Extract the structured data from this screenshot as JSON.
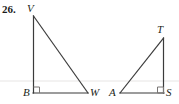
{
  "figure": {
    "problem_number": "26.",
    "background_color": "#ffffff",
    "stroke_color": "#3b3b3b",
    "faint_rule_color": "#e3e1e0",
    "label_color": "#231f20",
    "width": 179,
    "height": 104
  },
  "triangles": [
    {
      "name": "triangle-VBW",
      "vertices": [
        {
          "label": "V",
          "x": 33.5,
          "y": 16
        },
        {
          "label": "B",
          "x": 33.5,
          "y": 93
        },
        {
          "label": "W",
          "x": 88,
          "y": 93
        }
      ],
      "right_angle_at": "B",
      "right_angle_marker": {
        "x": 33.5,
        "y": 93,
        "size": 6,
        "dx": 1,
        "dy": -1
      }
    },
    {
      "name": "triangle-TAS",
      "vertices": [
        {
          "label": "T",
          "x": 163.5,
          "y": 38
        },
        {
          "label": "A",
          "x": 120,
          "y": 93
        },
        {
          "label": "S",
          "x": 163.5,
          "y": 93
        }
      ],
      "right_angle_at": "S",
      "right_angle_marker": {
        "x": 163.5,
        "y": 93,
        "size": 6,
        "dx": -1,
        "dy": -1
      }
    }
  ],
  "labels": [
    {
      "id": "label-V",
      "text": "V"
    },
    {
      "id": "label-B",
      "text": "B"
    },
    {
      "id": "label-W",
      "text": "W"
    },
    {
      "id": "label-A",
      "text": "A"
    },
    {
      "id": "label-T",
      "text": "T"
    },
    {
      "id": "label-S",
      "text": "S"
    }
  ],
  "faint_rule": {
    "y": 81,
    "x1": 0,
    "x2": 179
  }
}
